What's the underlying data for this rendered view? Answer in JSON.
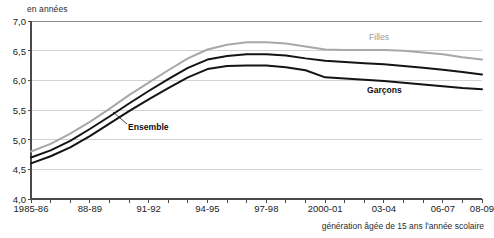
{
  "chart_data": {
    "type": "line",
    "title": "",
    "ylabel": "en années",
    "xlabel": "génération âgée de 15 ans l'année scolaire",
    "ylim": [
      4.0,
      7.0
    ],
    "ytick_labels": [
      "7,0",
      "6,5",
      "6,0",
      "5,5",
      "5,0",
      "4,5",
      "4,0"
    ],
    "ytick_values": [
      7.0,
      6.5,
      6.0,
      5.5,
      5.0,
      4.5,
      4.0
    ],
    "grid": true,
    "legend_position": "inline-annotations",
    "x": [
      "1985-86",
      "86-87",
      "87-88",
      "88-89",
      "89-90",
      "90-91",
      "91-92",
      "92-93",
      "93-94",
      "94-95",
      "95-96",
      "96-97",
      "97-98",
      "98-99",
      "99-2000",
      "2000-01",
      "01-02",
      "02-03",
      "03-04",
      "04-05",
      "05-06",
      "06-07",
      "07-08",
      "08-09"
    ],
    "xtick_labels": [
      "1985-86",
      "88-89",
      "91-92",
      "94-95",
      "97-98",
      "2000-01",
      "03-04",
      "06-07",
      "08-09"
    ],
    "xtick_label_positions": [
      0,
      3,
      6,
      9,
      12,
      15,
      18,
      21,
      23
    ],
    "series": [
      {
        "name": "Filles",
        "color": "#a8a8a8",
        "values": [
          4.8,
          4.93,
          5.1,
          5.3,
          5.52,
          5.75,
          5.96,
          6.17,
          6.37,
          6.52,
          6.6,
          6.64,
          6.64,
          6.62,
          6.57,
          6.52,
          6.51,
          6.51,
          6.51,
          6.5,
          6.47,
          6.44,
          6.39,
          6.35
        ]
      },
      {
        "name": "Ensemble",
        "color": "#141414",
        "values": [
          4.7,
          4.82,
          4.98,
          5.18,
          5.39,
          5.61,
          5.82,
          6.02,
          6.21,
          6.35,
          6.41,
          6.44,
          6.44,
          6.42,
          6.37,
          6.33,
          6.31,
          6.29,
          6.27,
          6.24,
          6.21,
          6.18,
          6.14,
          6.1
        ]
      },
      {
        "name": "Garçons",
        "color": "#141414",
        "values": [
          4.6,
          4.72,
          4.87,
          5.06,
          5.27,
          5.48,
          5.68,
          5.87,
          6.05,
          6.19,
          6.24,
          6.25,
          6.25,
          6.22,
          6.17,
          6.05,
          6.03,
          6.01,
          5.99,
          5.96,
          5.93,
          5.9,
          5.87,
          5.85
        ]
      }
    ],
    "annotations": [
      {
        "text": "Filles",
        "series": "Filles",
        "color": "#9a9a9a"
      },
      {
        "text": "Garçons",
        "series": "Garçons",
        "color": "#111111"
      },
      {
        "text": "Ensemble",
        "series": "Ensemble",
        "color": "#111111",
        "leader_line": true
      }
    ]
  }
}
